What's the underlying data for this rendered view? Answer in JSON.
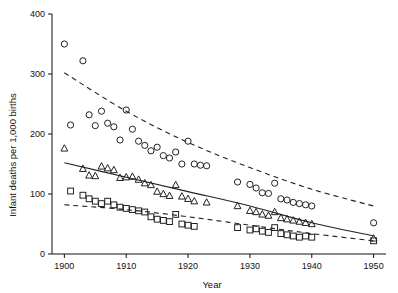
{
  "chart_data": {
    "type": "scatter",
    "title": "",
    "xlabel": "Year",
    "ylabel": "Infant deaths per 1,000 births",
    "xlim": [
      1898,
      1952
    ],
    "ylim": [
      0,
      400
    ],
    "xticks": [
      1900,
      1910,
      1920,
      1930,
      1940,
      1950
    ],
    "xtick_labels": [
      "1900",
      "1910",
      "1920",
      "1930",
      "1940",
      "1950"
    ],
    "yticks": [
      0,
      100,
      200,
      300,
      400
    ],
    "ytick_labels": [
      "0",
      "100",
      "200",
      "300",
      "400"
    ],
    "grid": false,
    "legend": "none",
    "series": [
      {
        "name": "circle-series",
        "marker": "circle",
        "color": "#222222",
        "points": [
          [
            1900,
            350
          ],
          [
            1901,
            215
          ],
          [
            1903,
            322
          ],
          [
            1904,
            232
          ],
          [
            1905,
            214
          ],
          [
            1906,
            238
          ],
          [
            1907,
            218
          ],
          [
            1908,
            212
          ],
          [
            1909,
            190
          ],
          [
            1910,
            240
          ],
          [
            1911,
            208
          ],
          [
            1912,
            188
          ],
          [
            1913,
            181
          ],
          [
            1914,
            172
          ],
          [
            1915,
            178
          ],
          [
            1916,
            164
          ],
          [
            1917,
            160
          ],
          [
            1918,
            170
          ],
          [
            1919,
            150
          ],
          [
            1920,
            188
          ],
          [
            1921,
            150
          ],
          [
            1922,
            148
          ],
          [
            1923,
            147
          ],
          [
            1928,
            120
          ],
          [
            1930,
            116
          ],
          [
            1931,
            110
          ],
          [
            1932,
            102
          ],
          [
            1933,
            101
          ],
          [
            1934,
            118
          ],
          [
            1935,
            92
          ],
          [
            1936,
            90
          ],
          [
            1937,
            86
          ],
          [
            1938,
            84
          ],
          [
            1939,
            82
          ],
          [
            1940,
            80
          ],
          [
            1950,
            52
          ]
        ]
      },
      {
        "name": "triangle-series",
        "marker": "triangle",
        "color": "#222222",
        "points": [
          [
            1900,
            176
          ],
          [
            1903,
            142
          ],
          [
            1904,
            131
          ],
          [
            1905,
            130
          ],
          [
            1906,
            146
          ],
          [
            1907,
            143
          ],
          [
            1908,
            140
          ],
          [
            1909,
            127
          ],
          [
            1910,
            128
          ],
          [
            1911,
            129
          ],
          [
            1912,
            124
          ],
          [
            1913,
            118
          ],
          [
            1914,
            115
          ],
          [
            1915,
            104
          ],
          [
            1916,
            100
          ],
          [
            1917,
            97
          ],
          [
            1918,
            115
          ],
          [
            1919,
            96
          ],
          [
            1920,
            92
          ],
          [
            1921,
            88
          ],
          [
            1923,
            86
          ],
          [
            1928,
            80
          ],
          [
            1930,
            72
          ],
          [
            1931,
            70
          ],
          [
            1932,
            66
          ],
          [
            1933,
            64
          ],
          [
            1934,
            70
          ],
          [
            1935,
            60
          ],
          [
            1936,
            58
          ],
          [
            1937,
            56
          ],
          [
            1938,
            54
          ],
          [
            1939,
            52
          ],
          [
            1940,
            50
          ],
          [
            1950,
            26
          ]
        ]
      },
      {
        "name": "square-series",
        "marker": "square",
        "color": "#222222",
        "points": [
          [
            1901,
            105
          ],
          [
            1903,
            98
          ],
          [
            1904,
            92
          ],
          [
            1905,
            88
          ],
          [
            1906,
            84
          ],
          [
            1907,
            88
          ],
          [
            1908,
            82
          ],
          [
            1909,
            78
          ],
          [
            1910,
            76
          ],
          [
            1911,
            74
          ],
          [
            1912,
            72
          ],
          [
            1913,
            70
          ],
          [
            1914,
            62
          ],
          [
            1915,
            58
          ],
          [
            1916,
            56
          ],
          [
            1917,
            54
          ],
          [
            1918,
            66
          ],
          [
            1919,
            50
          ],
          [
            1920,
            48
          ],
          [
            1921,
            46
          ],
          [
            1928,
            44
          ],
          [
            1930,
            40
          ],
          [
            1931,
            42
          ],
          [
            1932,
            38
          ],
          [
            1933,
            36
          ],
          [
            1934,
            44
          ],
          [
            1935,
            34
          ],
          [
            1936,
            32
          ],
          [
            1937,
            30
          ],
          [
            1938,
            28
          ],
          [
            1939,
            30
          ],
          [
            1940,
            28
          ],
          [
            1950,
            22
          ]
        ]
      }
    ],
    "fitted_curves": [
      {
        "name": "upper-dashed-curve",
        "style": "dashed",
        "x": [
          1900,
          1910,
          1920,
          1930,
          1940,
          1950
        ],
        "y": [
          302,
          238,
          186,
          144,
          108,
          80
        ]
      },
      {
        "name": "middle-solid-curve",
        "style": "solid",
        "x": [
          1900,
          1910,
          1920,
          1930,
          1940,
          1950
        ],
        "y": [
          152,
          128,
          104,
          80,
          52,
          30
        ]
      },
      {
        "name": "lower-dashed-curve",
        "style": "dashed",
        "x": [
          1900,
          1910,
          1920,
          1930,
          1940,
          1950
        ],
        "y": [
          82,
          74,
          62,
          48,
          34,
          22
        ]
      }
    ]
  },
  "axes": {
    "x_title": "Year",
    "y_title": "Infant deaths per 1,000 births"
  }
}
